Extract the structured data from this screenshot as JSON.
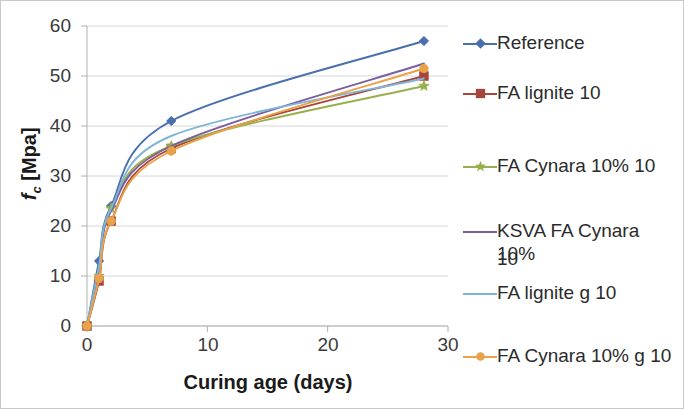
{
  "chart_data": {
    "type": "line",
    "title": "",
    "subtitle": "",
    "xlabel": "Curing age (days)",
    "ylabel": "f_c [Mpa]",
    "ylabel_parts": {
      "symbol": "f",
      "subscript": "c",
      "unit": "[Mpa]"
    },
    "xlim": [
      0,
      30
    ],
    "ylim": [
      0,
      60
    ],
    "xticks": [
      0,
      10,
      20,
      30
    ],
    "yticks": [
      0,
      10,
      20,
      30,
      40,
      50,
      60
    ],
    "xtick_labels": [
      "0",
      "10",
      "20",
      "30"
    ],
    "ytick_labels": [
      "0",
      "10",
      "20",
      "30",
      "40",
      "50",
      "60"
    ],
    "grid": "horizontal",
    "legend_position": "right",
    "x": [
      0,
      1,
      2,
      7,
      28
    ],
    "series": [
      {
        "name": "Reference",
        "color": "#4a6fae",
        "marker": "diamond",
        "values": [
          0,
          13,
          24,
          41,
          57
        ]
      },
      {
        "name": "FA lignite 10",
        "color": "#a8453a",
        "marker": "square",
        "values": [
          0,
          9,
          21,
          35.5,
          50
        ]
      },
      {
        "name": "FA Cynara 10% 10",
        "color": "#97b04a",
        "marker": "star",
        "values": [
          0,
          10,
          23.5,
          36,
          48
        ]
      },
      {
        "name": "KSVA FA  Cynara 10% 10",
        "color": "#7b5fa0",
        "marker": "none",
        "values": [
          0,
          10.5,
          23,
          36,
          52.5
        ]
      },
      {
        "name": "FA lignite g 10",
        "color": "#7fb4d6",
        "marker": "none",
        "values": [
          0,
          12,
          23.5,
          38,
          49.5
        ]
      },
      {
        "name": "FA  Cynara 10% g 10",
        "color": "#e8a24a",
        "marker": "circle",
        "values": [
          0,
          9.5,
          21,
          35,
          51.5
        ]
      }
    ]
  },
  "axes": {
    "x_axis_color": "#b0b0b0",
    "y_axis_color": "#b0b0b0",
    "gridline_color": "#d6d6d6"
  },
  "legend": {
    "items": [
      {
        "label": "Reference"
      },
      {
        "label": "FA lignite 10"
      },
      {
        "label": "FA Cynara 10% 10"
      },
      {
        "label": "KSVA FA  Cynara 10%"
      },
      {
        "label": "10"
      },
      {
        "label": "FA lignite g 10"
      },
      {
        "label": "FA  Cynara 10% g 10"
      }
    ]
  }
}
